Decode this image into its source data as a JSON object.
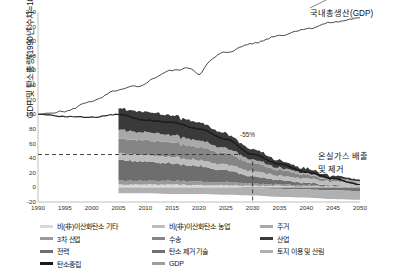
{
  "chart_data": {
    "type": "area",
    "title": "",
    "xlabel": "",
    "ylabel": "GDP 및 탄소총량(1990년 수치=100)",
    "xlim": [
      1990,
      2050
    ],
    "ylim": [
      -20,
      240
    ],
    "yticks": [
      -20,
      0,
      20,
      40,
      60,
      80,
      100,
      120,
      140,
      160,
      180,
      200,
      220,
      240
    ],
    "xticks": [
      1990,
      1995,
      2000,
      2005,
      2010,
      2015,
      2020,
      2025,
      2030,
      2035,
      2040,
      2045,
      2050
    ],
    "grid": false,
    "legend_position": "bottom",
    "annotations": [
      {
        "text": "국내총생산(GDP)",
        "x": 2046,
        "y": 232
      },
      {
        "text": "온실가스 배출",
        "x": 2043,
        "y": 57
      },
      {
        "text": "및 제거",
        "x": 2043,
        "y": 43
      },
      {
        "text": "-55%",
        "x": 2031,
        "y": 52
      }
    ],
    "reference_line": {
      "y": 45,
      "label": "-55%",
      "style": "dashed",
      "x_marker": 2030
    },
    "x": [
      1990,
      1995,
      2000,
      2005,
      2010,
      2015,
      2020,
      2025,
      2030,
      2035,
      2040,
      2045,
      2050
    ],
    "series": [
      {
        "name": "GDP",
        "type": "line",
        "color": "#4a4a4a",
        "values": [
          100,
          104,
          118,
          133,
          146,
          160,
          166,
          185,
          197,
          208,
          217,
          226,
          232
        ]
      },
      {
        "name": "온실가스 총배출량",
        "type": "line",
        "color": "#2b2b2b",
        "values": [
          100,
          97,
          96,
          100,
          92,
          89,
          80,
          66,
          45,
          32,
          21,
          12,
          4
        ]
      },
      {
        "name": "비(非)이산화탄소 기타",
        "type": "area",
        "color": "#d9d9d9",
        "values": [
          null,
          null,
          null,
          4,
          4,
          4,
          3,
          3,
          2,
          2,
          1,
          1,
          1
        ]
      },
      {
        "name": "3차 산업",
        "type": "area",
        "color": "#9a9a9a",
        "values": [
          null,
          null,
          null,
          6,
          5,
          5,
          5,
          4,
          3,
          2,
          2,
          1,
          1
        ]
      },
      {
        "name": "전력",
        "type": "area",
        "color": "#6e6e6e",
        "values": [
          null,
          null,
          null,
          28,
          26,
          24,
          21,
          16,
          10,
          6,
          3,
          1,
          0
        ]
      },
      {
        "name": "탄소중립",
        "type": "line",
        "color": "#1a1a1a",
        "values": [
          null,
          null,
          null,
          100,
          92,
          89,
          80,
          66,
          45,
          32,
          21,
          12,
          4
        ]
      },
      {
        "name": "비(非)이산화탄소 농업",
        "type": "area",
        "color": "#bdbdbd",
        "values": [
          null,
          null,
          null,
          9,
          9,
          9,
          8,
          8,
          7,
          6,
          6,
          5,
          5
        ]
      },
      {
        "name": "수송",
        "type": "area",
        "color": "#858585",
        "values": [
          null,
          null,
          null,
          20,
          20,
          20,
          18,
          15,
          11,
          8,
          5,
          3,
          1
        ]
      },
      {
        "name": "탄소 제거 기술",
        "type": "area",
        "color": "#707070",
        "values": [
          null,
          null,
          null,
          0,
          0,
          0,
          0,
          0,
          -1,
          -2,
          -3,
          -4,
          -5
        ]
      },
      {
        "name": "주거",
        "type": "area",
        "color": "#a8a8a8",
        "values": [
          null,
          null,
          null,
          12,
          11,
          10,
          9,
          7,
          5,
          3,
          2,
          1,
          1
        ]
      },
      {
        "name": "산업",
        "type": "area",
        "color": "#3a3a3a",
        "values": [
          null,
          null,
          null,
          29,
          28,
          27,
          25,
          20,
          14,
          10,
          6,
          4,
          2
        ]
      },
      {
        "name": "토지 이용 및 산림",
        "type": "area",
        "color": "#b0b0b0",
        "values": [
          null,
          null,
          null,
          -8,
          -8,
          -9,
          -9,
          -10,
          -10,
          -11,
          -11,
          -12,
          -12
        ]
      }
    ]
  },
  "legend": {
    "columns": [
      [
        {
          "label": "비(非)이산화탄소 기타",
          "color": "#d9d9d9"
        },
        {
          "label": "3차 산업",
          "color": "#9a9a9a"
        },
        {
          "label": "전력",
          "color": "#6e6e6e"
        },
        {
          "label": "탄소중립",
          "color": "#1a1a1a"
        }
      ],
      [
        {
          "label": "비(非)이산화탄소 농업",
          "color": "#bdbdbd"
        },
        {
          "label": "수송",
          "color": "#858585"
        },
        {
          "label": "탄소 제거 기술",
          "color": "#707070"
        },
        {
          "label": "GDP",
          "color": "#9e9e9e"
        }
      ],
      [
        {
          "label": "주거",
          "color": "#a8a8a8"
        },
        {
          "label": "산업",
          "color": "#3a3a3a"
        },
        {
          "label": "토지 이용 및 산림",
          "color": "#b0b0b0"
        }
      ]
    ]
  }
}
